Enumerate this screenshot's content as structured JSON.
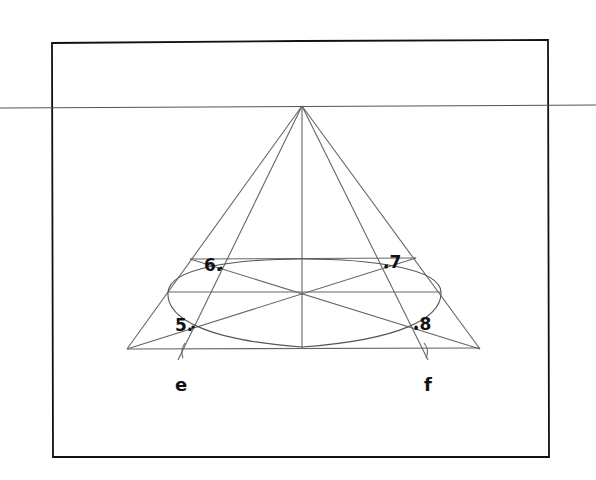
{
  "diagram": {
    "points": [
      {
        "id": "p5",
        "label": "5."
      },
      {
        "id": "p6",
        "label": "6."
      },
      {
        "id": "p7",
        "label": ".7"
      },
      {
        "id": "p8",
        "label": ".8"
      }
    ],
    "tick_labels": {
      "e": "e",
      "f": "f"
    },
    "colors": {
      "frame": "#111111",
      "lines": "#666666",
      "background": "#ffffff"
    }
  }
}
